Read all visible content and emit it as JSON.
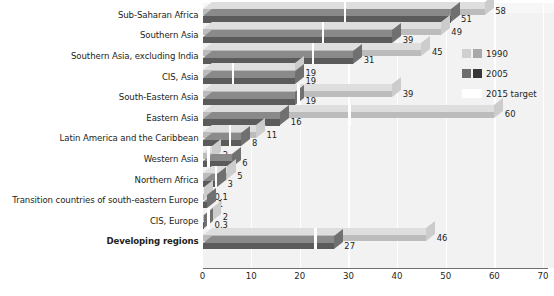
{
  "chart_data": {
    "type": "bar",
    "orientation": "horizontal",
    "title": "",
    "xlabel": "",
    "ylabel": "",
    "xlim": [
      0,
      70
    ],
    "xticks": [
      0,
      10,
      20,
      30,
      40,
      50,
      60,
      70
    ],
    "grid": true,
    "legend_position": "right",
    "categories": [
      "Sub-Saharan Africa",
      "Southern Asia",
      "Southern Asia, excluding India",
      "CIS, Asia",
      "South-Eastern Asia",
      "Eastern Asia",
      "Latin America and the Caribbean",
      "Western Asia",
      "Northern Africa",
      "Transition countries of south-eastern Europe",
      "CIS, Europe",
      "Developing regions"
    ],
    "series": [
      {
        "name": "1990",
        "color": "#bcbcbc",
        "color_top": "#d6d6d6",
        "values": [
          58,
          49,
          45,
          19,
          39,
          60,
          11,
          2,
          5,
          0.1,
          2,
          46
        ],
        "labels": [
          "58",
          "49",
          "45",
          "19",
          "39",
          "60",
          "11",
          "2",
          "5",
          "0.1",
          "2",
          "46"
        ]
      },
      {
        "name": "2005",
        "color": "#5b5b5b",
        "color_top": "#7a7a7a",
        "values": [
          51,
          39,
          31,
          19,
          19,
          16,
          8,
          6,
          3,
          1,
          0.3,
          27
        ],
        "labels": [
          "51",
          "39",
          "31",
          "19",
          "19",
          "16",
          "8",
          "6",
          "3",
          "1",
          "0.3",
          "27"
        ]
      }
    ],
    "target_marker": {
      "name": "2015 target",
      "color": "#ffffff",
      "description": "white notch at half the 1990 value",
      "values": [
        29,
        24.5,
        22.5,
        6,
        19.5,
        30,
        5.5,
        1,
        2.5,
        0.05,
        1,
        23
      ]
    },
    "bold_categories": [
      "Developing regions"
    ]
  },
  "legend": {
    "entries": [
      {
        "label": "1990",
        "swatch_a": "#cfcfcf",
        "swatch_b": "#a8a8a8"
      },
      {
        "label": "2005",
        "swatch_a": "#6d6d6d",
        "swatch_b": "#373737"
      },
      {
        "label": "2015 target",
        "swatch_a": "#ffffff",
        "swatch_b": "#ffffff"
      }
    ]
  },
  "axis": {
    "tick_labels": [
      "0",
      "10",
      "20",
      "30",
      "40",
      "50",
      "60",
      "70"
    ]
  },
  "colors": {
    "plot_background": "#f2f2f2",
    "gridline": "#ffffff",
    "text": "#231f20",
    "bar_1990": "#bcbcbc",
    "bar_2005": "#5b5b5b",
    "target": "#ffffff"
  }
}
